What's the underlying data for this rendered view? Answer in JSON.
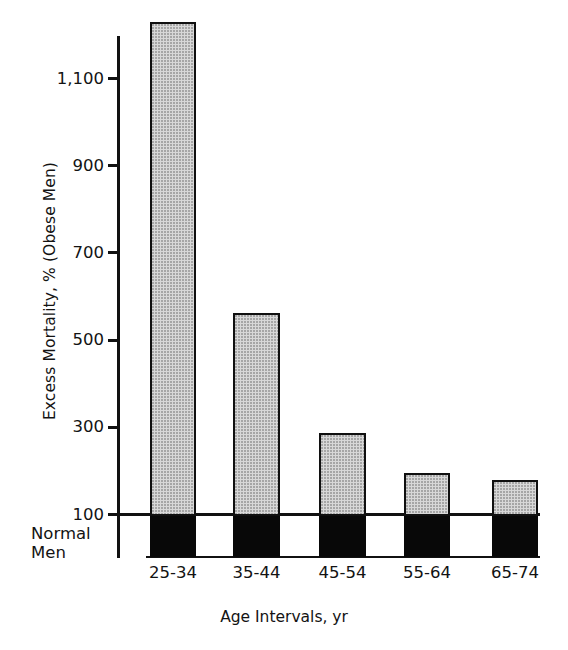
{
  "chart_data": {
    "type": "bar",
    "title": "",
    "subtitle": "",
    "xlabel": "Age Intervals, yr",
    "ylabel": "Excess Mortality, % (Obese Men)",
    "categories": [
      "25-34",
      "35-44",
      "45-54",
      "55-64",
      "65-74"
    ],
    "values": [
      1230,
      562,
      287,
      195,
      179
    ],
    "baseline": 100,
    "baseline_label_line1": "Normal",
    "baseline_label_line2": "Men",
    "ylim": [
      0,
      1260
    ],
    "yticks": [
      100,
      300,
      500,
      700,
      900,
      1100
    ],
    "ytick_labels": [
      "100",
      "300",
      "500",
      "700",
      "900",
      "1,100"
    ],
    "grid": false,
    "legend": null,
    "series": [
      {
        "name": "Excess Mortality, % (Obese Men)",
        "values": [
          1230,
          562,
          287,
          195,
          179
        ]
      }
    ],
    "colors": {
      "bar_upper_fill": "#d8d8d8",
      "bar_lower_fill": "#080808",
      "bar_outline": "#101010",
      "axis": "#111111",
      "text": "#131313",
      "background": "#ffffff"
    }
  },
  "axis": {
    "y_title": "Excess Mortality, % (Obese Men)",
    "x_title": "Age Intervals, yr"
  },
  "ticks": [
    {
      "label": "1,100",
      "value": 1100
    },
    {
      "label": "900",
      "value": 900
    },
    {
      "label": "700",
      "value": 700
    },
    {
      "label": "500",
      "value": 500
    },
    {
      "label": "300",
      "value": 300
    },
    {
      "label": "100",
      "value": 100
    }
  ],
  "bars": [
    {
      "category": "25-34",
      "value": 1230
    },
    {
      "category": "35-44",
      "value": 562
    },
    {
      "category": "45-54",
      "value": 287
    },
    {
      "category": "55-64",
      "value": 195
    },
    {
      "category": "65-74",
      "value": 179
    }
  ],
  "baseline_note": {
    "line1": "Normal",
    "line2": "Men"
  }
}
